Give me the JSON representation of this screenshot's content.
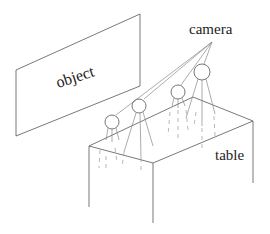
{
  "labels": {
    "object": "object",
    "camera": "camera",
    "table": "table"
  },
  "figure": {
    "type": "schematic",
    "elements": [
      "object plane",
      "four cameras on tripods",
      "table"
    ],
    "camera_count": 4
  }
}
